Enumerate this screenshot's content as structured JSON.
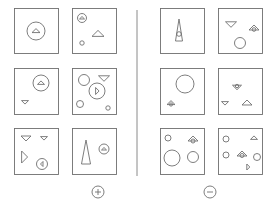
{
  "title": "Bongard problem: positive vs negative examples",
  "colors": {
    "stroke": "#6f6f6f",
    "background": "#ffffff",
    "divider": "#8a8a8a"
  },
  "groups": [
    {
      "name": "positive",
      "symbol": "+",
      "symbol_pos": [
        98,
        192
      ],
      "panels": [
        {
          "x": 14,
          "y": 8,
          "w": 44,
          "h": 45,
          "shapes": [
            {
              "type": "circle",
              "cx": 36,
              "cy": 31,
              "r": 9
            },
            {
              "type": "tri",
              "cx": 36,
              "cy": 31,
              "s": 4,
              "dir": "up"
            }
          ]
        },
        {
          "x": 72,
          "y": 8,
          "w": 44,
          "h": 45,
          "shapes": [
            {
              "type": "circle",
              "cx": 82,
              "cy": 18,
              "r": 4.5
            },
            {
              "type": "tri",
              "cx": 82,
              "cy": 18,
              "s": 2.5,
              "dir": "up"
            },
            {
              "type": "tri",
              "cx": 98,
              "cy": 34,
              "s": 6,
              "dir": "up"
            },
            {
              "type": "circle",
              "cx": 82,
              "cy": 43,
              "r": 2.2
            }
          ]
        },
        {
          "x": 14,
          "y": 68,
          "w": 44,
          "h": 46,
          "shapes": [
            {
              "type": "circle",
              "cx": 41,
              "cy": 83,
              "r": 8
            },
            {
              "type": "tri",
              "cx": 41,
              "cy": 83,
              "s": 3.5,
              "dir": "up"
            },
            {
              "type": "tri",
              "cx": 25,
              "cy": 102,
              "s": 3.5,
              "dir": "down"
            }
          ]
        },
        {
          "x": 72,
          "y": 68,
          "w": 44,
          "h": 46,
          "shapes": [
            {
              "type": "circle",
              "cx": 84,
              "cy": 80,
              "r": 5.5
            },
            {
              "type": "tri",
              "cx": 104,
              "cy": 78,
              "s": 5.5,
              "dir": "down"
            },
            {
              "type": "circle",
              "cx": 97,
              "cy": 91,
              "r": 8
            },
            {
              "type": "tri",
              "cx": 97,
              "cy": 91,
              "s": 3.5,
              "dir": "right"
            },
            {
              "type": "circle",
              "cx": 80,
              "cy": 104,
              "r": 3.5
            },
            {
              "type": "circle",
              "cx": 108,
              "cy": 108,
              "r": 2.2
            }
          ]
        },
        {
          "x": 14,
          "y": 128,
          "w": 44,
          "h": 46,
          "shapes": [
            {
              "type": "tri",
              "cx": 26,
              "cy": 138,
              "s": 5,
              "dir": "down"
            },
            {
              "type": "tri",
              "cx": 44,
              "cy": 138,
              "s": 3.5,
              "dir": "down"
            },
            {
              "type": "tri",
              "cx": 24,
              "cy": 157,
              "s": 6,
              "dir": "right"
            },
            {
              "type": "circle",
              "cx": 42,
              "cy": 164,
              "r": 5.5
            },
            {
              "type": "tri",
              "cx": 42,
              "cy": 164,
              "s": 2.5,
              "dir": "left"
            }
          ]
        },
        {
          "x": 72,
          "y": 128,
          "w": 44,
          "h": 46,
          "shapes": [
            {
              "type": "tall",
              "cx": 86,
              "cy": 152,
              "w": 9,
              "h": 24
            },
            {
              "type": "circle",
              "cx": 104,
              "cy": 149,
              "r": 5
            },
            {
              "type": "tri",
              "cx": 104,
              "cy": 149,
              "s": 2.5,
              "dir": "up"
            }
          ]
        }
      ]
    },
    {
      "name": "negative",
      "symbol": "−",
      "symbol_pos": [
        210,
        192
      ],
      "panels": [
        {
          "x": 160,
          "y": 8,
          "w": 44,
          "h": 45,
          "shapes": [
            {
              "type": "tall",
              "cx": 179,
              "cy": 30,
              "w": 7,
              "h": 22
            },
            {
              "type": "circle",
              "cx": 179,
              "cy": 34,
              "r": 2.3
            }
          ]
        },
        {
          "x": 218,
          "y": 8,
          "w": 44,
          "h": 45,
          "shapes": [
            {
              "type": "tri",
              "cx": 231,
              "cy": 24,
              "s": 5.5,
              "dir": "down"
            },
            {
              "type": "tri",
              "cx": 254,
              "cy": 28,
              "s": 5,
              "dir": "up"
            },
            {
              "type": "circle",
              "cx": 254,
              "cy": 29.5,
              "r": 1.8
            },
            {
              "type": "circle",
              "cx": 240,
              "cy": 43,
              "r": 5.5
            }
          ]
        },
        {
          "x": 160,
          "y": 68,
          "w": 44,
          "h": 46,
          "shapes": [
            {
              "type": "circle",
              "cx": 185,
              "cy": 84,
              "r": 9
            },
            {
              "type": "tri",
              "cx": 171,
              "cy": 103,
              "s": 4,
              "dir": "up"
            },
            {
              "type": "circle",
              "cx": 171,
              "cy": 104.5,
              "r": 1.6
            }
          ]
        },
        {
          "x": 218,
          "y": 68,
          "w": 44,
          "h": 46,
          "shapes": [
            {
              "type": "tri",
              "cx": 237,
              "cy": 87,
              "s": 4.5,
              "dir": "down"
            },
            {
              "type": "circle",
              "cx": 237,
              "cy": 86,
              "r": 1.7
            },
            {
              "type": "tri",
              "cx": 225,
              "cy": 103,
              "s": 3.5,
              "dir": "down"
            },
            {
              "type": "tri",
              "cx": 247,
              "cy": 103,
              "s": 5,
              "dir": "up"
            }
          ]
        },
        {
          "x": 160,
          "y": 128,
          "w": 44,
          "h": 46,
          "shapes": [
            {
              "type": "circle",
              "cx": 168,
              "cy": 138,
              "r": 3
            },
            {
              "type": "tri",
              "cx": 193,
              "cy": 139,
              "s": 5,
              "dir": "up"
            },
            {
              "type": "circle",
              "cx": 193,
              "cy": 141,
              "r": 2
            },
            {
              "type": "circle",
              "cx": 172,
              "cy": 158,
              "r": 8
            },
            {
              "type": "circle",
              "cx": 193,
              "cy": 157,
              "r": 5.5
            }
          ]
        },
        {
          "x": 218,
          "y": 128,
          "w": 44,
          "h": 46,
          "shapes": [
            {
              "type": "circle",
              "cx": 226,
              "cy": 139,
              "r": 3
            },
            {
              "type": "tri",
              "cx": 254,
              "cy": 138,
              "s": 3.5,
              "dir": "up"
            },
            {
              "type": "circle",
              "cx": 226,
              "cy": 155,
              "r": 3
            },
            {
              "type": "tri",
              "cx": 242,
              "cy": 154,
              "s": 5,
              "dir": "up"
            },
            {
              "type": "circle",
              "cx": 242,
              "cy": 155.5,
              "r": 2
            },
            {
              "type": "circle",
              "cx": 257,
              "cy": 157,
              "r": 3.5
            },
            {
              "type": "tri",
              "cx": 248,
              "cy": 167,
              "s": 3,
              "dir": "right"
            }
          ]
        }
      ]
    }
  ],
  "divider": {
    "x": 137,
    "y1": 10,
    "y2": 176
  }
}
